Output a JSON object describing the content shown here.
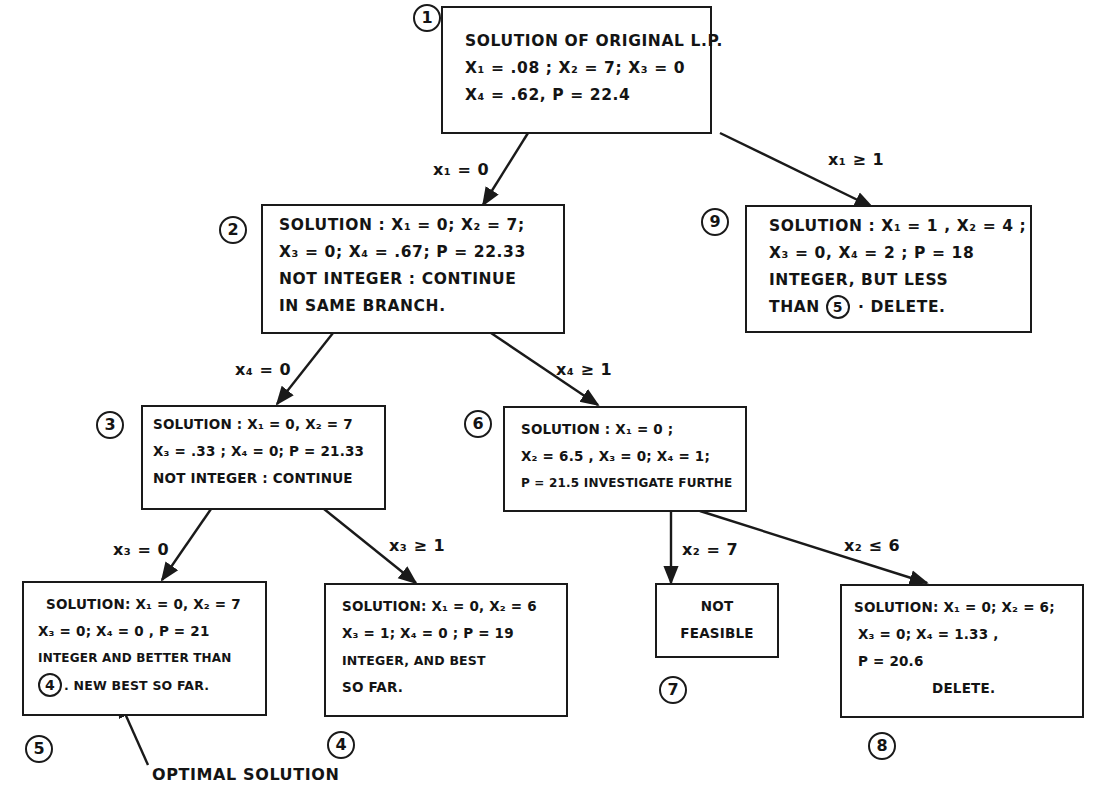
{
  "diagram": {
    "type": "branch-and-bound tree",
    "nodes": [
      {
        "id": "1",
        "label": "1",
        "lines": [
          "Solution of original L.P.",
          "x₁ = .08 ;  x₂ = 7;  x₃ = 0",
          "x₄ = .62,   P = 22.4"
        ]
      },
      {
        "id": "2",
        "label": "2",
        "lines": [
          "Solution : x₁ = 0; x₂ = 7;",
          "x₃ = 0;  x₄ = .67;  P = 22.33",
          "Not integer : continue",
          "in same branch."
        ]
      },
      {
        "id": "9",
        "label": "9",
        "lines": [
          "Solution : x₁ = 1 , x₂ = 4 ;",
          "x₃ = 0,  x₄ = 2 ;   P = 18",
          "Integer, but less"
        ],
        "last_line_prefix": "than",
        "last_line_ref": "5",
        "last_line_suffix": " ·  Delete."
      },
      {
        "id": "3",
        "label": "3",
        "lines": [
          "Solution : x₁ = 0,  x₂ = 7",
          "x₃ = .33 ; x₄ = 0; P = 21.33",
          "Not integer : continue"
        ]
      },
      {
        "id": "6",
        "label": "6",
        "lines": [
          "Solution : x₁ = 0 ;",
          "x₂ = 6.5 ,  x₃ = 0; x₄ = 1;",
          "P = 21.5  Investigate further"
        ]
      },
      {
        "id": "5",
        "label": "5",
        "lines": [
          "Solution:  x₁ = 0,  x₂ = 7",
          "x₃ = 0;  x₄ = 0 ,   P = 21",
          "Integer and better than"
        ],
        "last_line_ref": "4",
        "last_line_suffix": ". New best so far."
      },
      {
        "id": "4",
        "label": "4",
        "lines": [
          "Solution: x₁ = 0,  x₂ = 6",
          "x₃ = 1;  x₄ = 0 ;   P = 19",
          "Integer, and best",
          "so far."
        ]
      },
      {
        "id": "7",
        "label": "7",
        "lines": [
          "Not",
          "Feasible"
        ]
      },
      {
        "id": "8",
        "label": "8",
        "lines": [
          "Solution: x₁ = 0; x₂ = 6;",
          "x₃ = 0;  x₄ = 1.33 ,",
          "P = 20.6",
          "Delete."
        ]
      }
    ],
    "edges": [
      {
        "from": "1",
        "to": "2",
        "label": "x₁ = 0"
      },
      {
        "from": "1",
        "to": "9",
        "label": "x₁ ≥ 1"
      },
      {
        "from": "2",
        "to": "3",
        "label": "x₄ = 0"
      },
      {
        "from": "2",
        "to": "6",
        "label": "x₄ ≥ 1"
      },
      {
        "from": "3",
        "to": "5",
        "label": "x₃ = 0"
      },
      {
        "from": "3",
        "to": "4",
        "label": "x₃ ≥ 1"
      },
      {
        "from": "6",
        "to": "7",
        "label": "x₂ = 7"
      },
      {
        "from": "6",
        "to": "8",
        "label": "x₂ ≤ 6"
      }
    ],
    "annotation": {
      "text": "Optimal solution",
      "points_to": "5"
    }
  }
}
